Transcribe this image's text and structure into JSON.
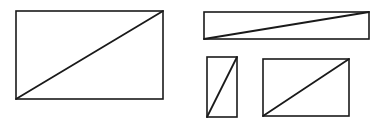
{
  "diagram": {
    "background": "#ffffff",
    "stroke_color": "#1a1a1a",
    "rect_stroke_width": 1.6,
    "diagonal_stroke_width": 1.8,
    "shapes": [
      {
        "name": "large-rectangle",
        "x": 16,
        "y": 11,
        "w": 147,
        "h": 88,
        "diagonal": "bottom-left-to-top-right"
      },
      {
        "name": "wide-rectangle",
        "x": 204,
        "y": 12,
        "w": 165,
        "h": 27,
        "diagonal": "bottom-left-to-top-right"
      },
      {
        "name": "tall-rectangle",
        "x": 207,
        "y": 57,
        "w": 30,
        "h": 60,
        "diagonal": "bottom-left-to-top-right"
      },
      {
        "name": "medium-rectangle",
        "x": 263,
        "y": 59,
        "w": 86,
        "h": 57,
        "diagonal": "bottom-left-to-top-right"
      }
    ]
  }
}
